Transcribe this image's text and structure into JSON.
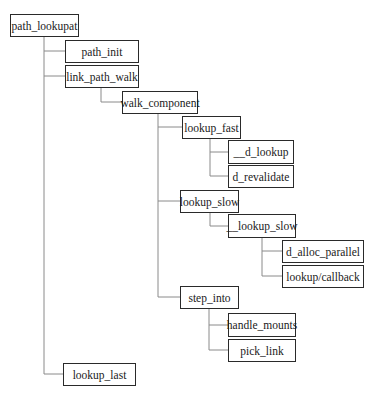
{
  "diagram": {
    "type": "call-tree",
    "root": "path_lookupat",
    "nodes": [
      {
        "id": "path_lookupat",
        "label": "path_lookupat",
        "parent": null
      },
      {
        "id": "path_init",
        "label": "path_init",
        "parent": "path_lookupat"
      },
      {
        "id": "link_path_walk",
        "label": "link_path_walk",
        "parent": "path_lookupat"
      },
      {
        "id": "walk_component",
        "label": "walk_component",
        "parent": "link_path_walk"
      },
      {
        "id": "lookup_fast",
        "label": "lookup_fast",
        "parent": "walk_component"
      },
      {
        "id": "__d_lookup",
        "label": "__d_lookup",
        "parent": "lookup_fast"
      },
      {
        "id": "d_revalidate",
        "label": "d_revalidate",
        "parent": "lookup_fast"
      },
      {
        "id": "lookup_slow",
        "label": "lookup_slow",
        "parent": "walk_component"
      },
      {
        "id": "__lookup_slow",
        "label": "__lookup_slow",
        "parent": "lookup_slow"
      },
      {
        "id": "d_alloc_parallel",
        "label": "d_alloc_parallel",
        "parent": "__lookup_slow"
      },
      {
        "id": "lookup_callback",
        "label": "lookup/callback",
        "parent": "__lookup_slow"
      },
      {
        "id": "step_into",
        "label": "step_into",
        "parent": "walk_component"
      },
      {
        "id": "handle_mounts",
        "label": "handle_mounts",
        "parent": "step_into"
      },
      {
        "id": "pick_link",
        "label": "pick_link",
        "parent": "step_into"
      },
      {
        "id": "lookup_last",
        "label": "lookup_last",
        "parent": "path_lookupat"
      }
    ]
  },
  "labels": {
    "path_lookupat": "path_lookupat",
    "path_init": "path_init",
    "link_path_walk": "link_path_walk",
    "walk_component": "walk_component",
    "lookup_fast": "lookup_fast",
    "d_lookup": "__d_lookup",
    "d_revalidate": "d_revalidate",
    "lookup_slow": "lookup_slow",
    "lookup_slow_inner": "__lookup_slow",
    "d_alloc_parallel": "d_alloc_parallel",
    "lookup_callback": "lookup/callback",
    "step_into": "step_into",
    "handle_mounts": "handle_mounts",
    "pick_link": "pick_link",
    "lookup_last": "lookup_last"
  },
  "colors": {
    "border": "#2a2a2a",
    "connector": "#8a8a8a",
    "background": "#ffffff"
  }
}
